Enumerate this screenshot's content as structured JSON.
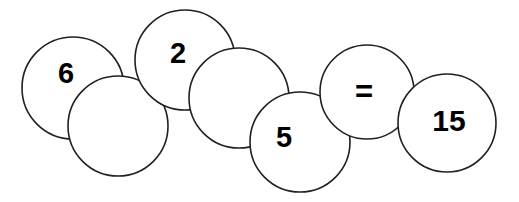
{
  "canvas": {
    "width": 519,
    "height": 202,
    "background_color": "#ffffff",
    "stroke_color": "#231f20",
    "text_color": "#000000"
  },
  "diagram": {
    "name": "overlapping-circle-equation-chain",
    "equation_text": "6 2 5 = 15",
    "nodes": [
      {
        "id": "circle-6",
        "label": "6",
        "has_label": true,
        "cx": 73,
        "cy": 88,
        "r": 51,
        "label_x": 66,
        "label_y": 73,
        "font_size": 29
      },
      {
        "id": "circle-blank-1",
        "label": "",
        "has_label": false,
        "cx": 118,
        "cy": 126,
        "r": 50,
        "label_x": 118,
        "label_y": 126,
        "font_size": 29
      },
      {
        "id": "circle-2",
        "label": "2",
        "has_label": true,
        "cx": 185,
        "cy": 60,
        "r": 50,
        "label_x": 178,
        "label_y": 53,
        "font_size": 29
      },
      {
        "id": "circle-blank-2",
        "label": "",
        "has_label": false,
        "cx": 239,
        "cy": 98,
        "r": 50,
        "label_x": 239,
        "label_y": 98,
        "font_size": 29
      },
      {
        "id": "circle-5",
        "label": "5",
        "has_label": true,
        "cx": 300,
        "cy": 142,
        "r": 50,
        "label_x": 284,
        "label_y": 137,
        "font_size": 29
      },
      {
        "id": "circle-equals",
        "label": "=",
        "has_label": true,
        "cx": 367,
        "cy": 92,
        "r": 47,
        "label_x": 364,
        "label_y": 91,
        "font_size": 31
      },
      {
        "id": "circle-15",
        "label": "15",
        "has_label": true,
        "cx": 447,
        "cy": 123,
        "r": 49,
        "label_x": 449,
        "label_y": 121,
        "font_size": 30
      }
    ]
  }
}
